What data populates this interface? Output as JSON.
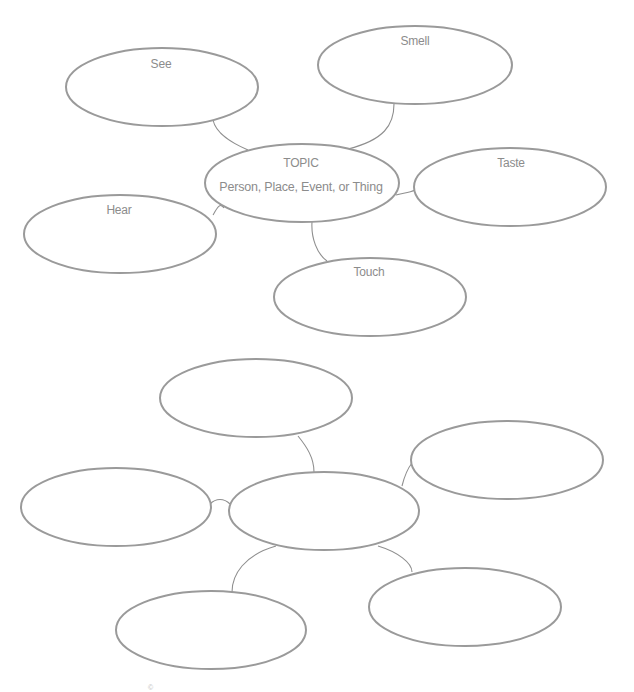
{
  "diagram_1": {
    "type": "sensory-web",
    "center": {
      "title": "TOPIC",
      "subtitle": "Person, Place, Event, or Thing"
    },
    "bubbles": [
      {
        "id": "see",
        "label": "See"
      },
      {
        "id": "smell",
        "label": "Smell"
      },
      {
        "id": "taste",
        "label": "Taste"
      },
      {
        "id": "hear",
        "label": "Hear"
      },
      {
        "id": "touch",
        "label": "Touch"
      }
    ]
  },
  "diagram_2": {
    "type": "blank-web",
    "center": {
      "label": ""
    },
    "bubbles": [
      {
        "id": "top",
        "label": ""
      },
      {
        "id": "right",
        "label": ""
      },
      {
        "id": "left",
        "label": ""
      },
      {
        "id": "lower-left",
        "label": ""
      },
      {
        "id": "lower-right",
        "label": ""
      }
    ]
  },
  "colors": {
    "outline": "#9a9a9a",
    "text": "#8c8c8c",
    "background": "#ffffff"
  },
  "footer": {
    "text": "©"
  }
}
